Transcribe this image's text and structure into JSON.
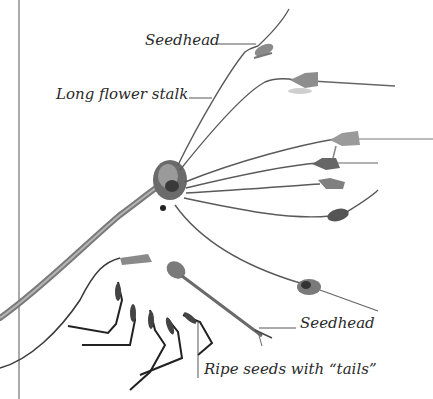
{
  "figure": {
    "labels": {
      "seedhead_top": "Seedhead",
      "long_flower_stalk": "Long flower stalk",
      "seedhead_bottom": "Seedhead",
      "ripe_seeds": "Ripe seeds with “tails”"
    },
    "colors": {
      "background": "#ffffff",
      "text": "#2a2a2a",
      "leader_line": "#555555",
      "stem": "#5a5a5a",
      "seedhead": "#6e6e6e",
      "seed_dark": "#2e2e2e"
    }
  }
}
